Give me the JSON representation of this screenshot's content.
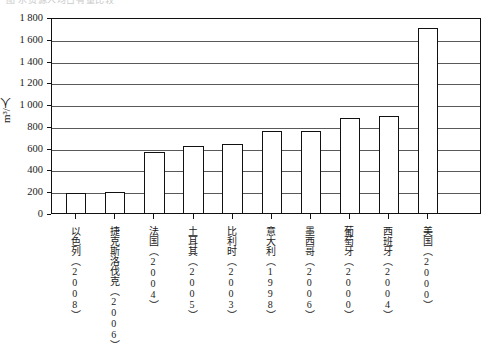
{
  "caption": {
    "text": "图 水资源人均占有量比较"
  },
  "chart_data": {
    "type": "bar",
    "title": "",
    "xlabel": "",
    "ylabel": "m3/人",
    "ylabel_display": "m³/人",
    "ylim": [
      0,
      1800
    ],
    "ytick_step": 200,
    "grid": true,
    "legend": "none",
    "yticks": [
      "1 800",
      "1 600",
      "1 400",
      "1 200",
      "1 000",
      "800",
      "600",
      "400",
      "200",
      "0"
    ],
    "ytick_values": [
      1800,
      1600,
      1400,
      1200,
      1000,
      800,
      600,
      400,
      200,
      0
    ],
    "categories": [
      "以色列（2008）",
      "捷克斯洛伐克（2006）",
      "法国（2004）",
      "土耳其（2005）",
      "比利时（2003）",
      "意大利（1998）",
      "墨西哥（2006）",
      "葡萄牙（2000）",
      "西班牙（2004）",
      "美国（2000）"
    ],
    "values": [
      180,
      190,
      560,
      620,
      630,
      750,
      750,
      870,
      890,
      1700
    ],
    "series": [
      {
        "name": "人均水资源占有量",
        "values": [
          180,
          190,
          560,
          620,
          630,
          750,
          750,
          870,
          890,
          1700
        ]
      }
    ],
    "bar_color": "#ffffff",
    "bar_edge_color": "#111111",
    "grid_color": "#595959",
    "axis_color": "#111111"
  }
}
